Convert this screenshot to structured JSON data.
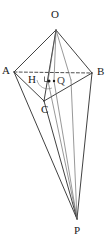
{
  "figure": {
    "name": "solid-geometry-figure",
    "background_color": "#ffffff",
    "stroke_color": "#2b2b2b",
    "thin_stroke_color": "#555555",
    "dashed_stroke_color": "#3a3a3a"
  },
  "labels": [
    {
      "id": "O",
      "text": "O",
      "x": 51,
      "y": 9
    },
    {
      "id": "A",
      "text": "A",
      "x": 2,
      "y": 65
    },
    {
      "id": "B",
      "text": "B",
      "x": 97,
      "y": 66
    },
    {
      "id": "H",
      "text": "H",
      "x": 28,
      "y": 74
    },
    {
      "id": "Q",
      "text": "Q",
      "x": 57,
      "y": 75
    },
    {
      "id": "C",
      "text": "C",
      "x": 41,
      "y": 106
    },
    {
      "id": "P",
      "text": "P",
      "x": 74,
      "y": 225
    }
  ],
  "points": {
    "O": {
      "x": 56,
      "y": 30
    },
    "A": {
      "x": 14,
      "y": 72
    },
    "B": {
      "x": 92,
      "y": 73
    },
    "C": {
      "x": 44,
      "y": 101
    },
    "H": {
      "x": 48,
      "y": 80
    },
    "Q": {
      "x": 54,
      "y": 80
    },
    "P": {
      "x": 77,
      "y": 219
    },
    "E": {
      "x": 71,
      "y": 80
    }
  },
  "segments": [
    {
      "name": "edge-O-A",
      "from": "O",
      "to": "A",
      "style": "solid"
    },
    {
      "name": "edge-O-B",
      "from": "O",
      "to": "B",
      "style": "solid"
    },
    {
      "name": "edge-O-C",
      "from": "O",
      "to": "C",
      "style": "solid"
    },
    {
      "name": "edge-A-B",
      "from": "A",
      "to": "B",
      "style": "dashed"
    },
    {
      "name": "edge-A-C",
      "from": "A",
      "to": "C",
      "style": "solid"
    },
    {
      "name": "edge-C-B",
      "from": "C",
      "to": "B",
      "style": "solid"
    },
    {
      "name": "edge-A-P",
      "from": "A",
      "to": "P",
      "style": "solid"
    },
    {
      "name": "edge-B-P",
      "from": "B",
      "to": "P",
      "style": "solid"
    },
    {
      "name": "edge-C-P",
      "from": "C",
      "to": "P",
      "style": "solid"
    },
    {
      "name": "altitude-O-H",
      "from": "O",
      "to": "H",
      "style": "thin"
    },
    {
      "name": "altitude-H-P",
      "from": "H",
      "to": "P",
      "style": "thin"
    },
    {
      "name": "cevian-O-Q",
      "from": "O",
      "to": "Q",
      "style": "thin"
    },
    {
      "name": "cevian-Q-P",
      "from": "Q",
      "to": "P",
      "style": "thin"
    },
    {
      "name": "cevian-E-P",
      "from": "E",
      "to": "P",
      "style": "thin"
    }
  ],
  "markers": {
    "right_angle": {
      "name": "right-angle-marker",
      "x": 45,
      "y": 77,
      "size": 5
    },
    "foot_dot": {
      "name": "foot-point-dot",
      "x": 49,
      "y": 81,
      "r": 1.5
    },
    "second_dot": {
      "name": "second-point-dot",
      "x": 54,
      "y": 81,
      "r": 1.2
    },
    "angle_arc": {
      "name": "angle-arc-at-H",
      "cx": 48,
      "cy": 80,
      "r": 11
    }
  }
}
